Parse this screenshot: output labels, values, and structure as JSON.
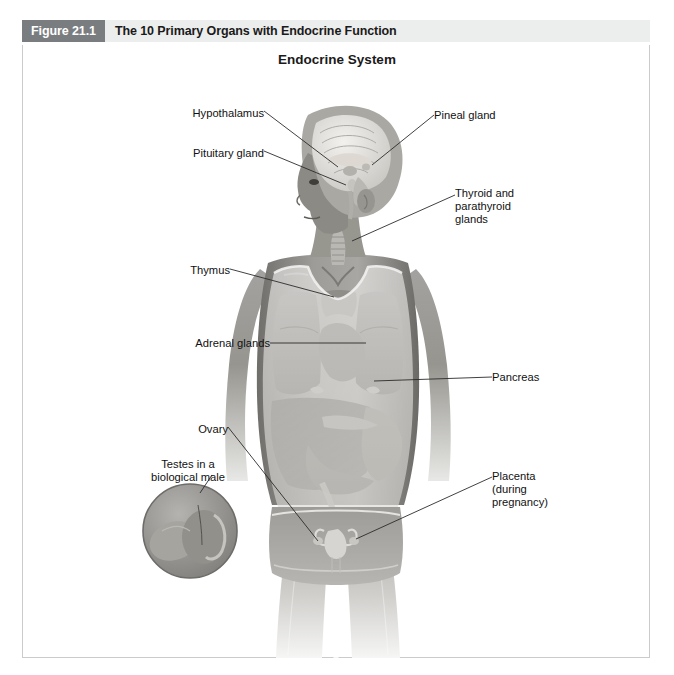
{
  "header": {
    "figure_number": "Figure 21.1",
    "figure_title": "The 10 Primary Organs with Endocrine Function"
  },
  "diagram": {
    "title": "Endocrine System",
    "labels": [
      {
        "id": "hypothalamus",
        "text": "Hypothalamus",
        "align": "right",
        "x": 178,
        "y": 107,
        "width": 86
      },
      {
        "id": "pituitary",
        "text": "Pituitary gland",
        "align": "right",
        "x": 166,
        "y": 147,
        "width": 98
      },
      {
        "id": "pineal",
        "text": "Pineal gland",
        "align": "left",
        "x": 434,
        "y": 109,
        "width": 90
      },
      {
        "id": "thyroid",
        "text": "Thyroid and\nparathyroid\nglands",
        "align": "left",
        "x": 455,
        "y": 187,
        "width": 86
      },
      {
        "id": "thymus",
        "text": "Thymus",
        "align": "right",
        "x": 180,
        "y": 264,
        "width": 50
      },
      {
        "id": "adrenal",
        "text": "Adrenal glands",
        "align": "right",
        "x": 174,
        "y": 337,
        "width": 96
      },
      {
        "id": "pancreas",
        "text": "Pancreas",
        "align": "left",
        "x": 492,
        "y": 371,
        "width": 64
      },
      {
        "id": "ovary",
        "text": "Ovary",
        "align": "right",
        "x": 180,
        "y": 423,
        "width": 48
      },
      {
        "id": "placenta",
        "text": "Placenta\n(during\npregnancy)",
        "align": "left",
        "x": 492,
        "y": 470,
        "width": 76
      },
      {
        "id": "testes",
        "text": "Testes in a\nbiological male",
        "align": "center",
        "x": 133,
        "y": 458,
        "width": 110
      }
    ],
    "inset": {
      "id": "testes-inset",
      "description": "circular inset illustration of testis and epididymis",
      "center_x": 190,
      "center_y": 531,
      "radius": 47
    },
    "colors": {
      "figure_number_bg": "#7a7d80",
      "header_bg": "#eceded",
      "frame_border": "#c9cbcc",
      "label_text": "#111111",
      "leader_line": "#2b2b2b",
      "skin_mid": "#8e8d8a",
      "organ_dark": "#6e6d6a",
      "page_bg": "#ffffff"
    }
  }
}
